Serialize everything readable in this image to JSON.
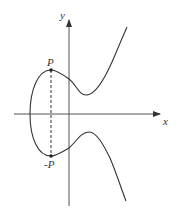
{
  "diagram": {
    "type": "elliptic-curve-point-negation",
    "axes": {
      "x_label": "x",
      "y_label": "y"
    },
    "points": [
      {
        "label": "P",
        "position": "upper",
        "x_px": 51,
        "y_px": 70
      },
      {
        "label": "-P",
        "position": "lower",
        "x_px": 51,
        "y_px": 156
      }
    ],
    "connector": {
      "style": "dashed",
      "from": "P",
      "to": "-P"
    },
    "colors": {
      "stroke": "#333333",
      "background": "#ffffff"
    }
  }
}
